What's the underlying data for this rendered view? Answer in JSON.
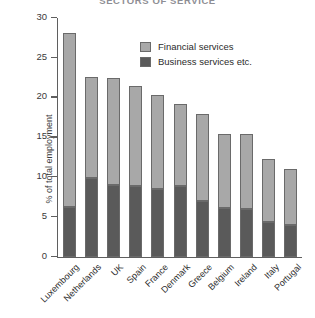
{
  "chart_data": {
    "type": "bar",
    "subtype": "stacked-vertical",
    "title": "SECTORS OF SERVICE",
    "xlabel": "",
    "ylabel": "% of total employment",
    "ylim": [
      0,
      30
    ],
    "yticks": [
      0,
      5,
      10,
      15,
      20,
      25,
      30
    ],
    "ytick_labels": [
      "0",
      "5",
      "10",
      "15",
      "20",
      "25",
      "30"
    ],
    "grid": false,
    "legend_position": "upper-right-inside",
    "categories": [
      "Luxembourg",
      "Netherlands",
      "UK",
      "Spain",
      "France",
      "Denmark",
      "Greece",
      "Belgium",
      "Ireland",
      "Italy",
      "Portugal"
    ],
    "series": [
      {
        "name": "Business services etc.",
        "color": "#5a5a5a",
        "values": [
          6.3,
          9.9,
          9.0,
          8.9,
          8.6,
          8.9,
          7.0,
          6.2,
          6.0,
          4.4,
          4.0
        ]
      },
      {
        "name": "Financial services",
        "color": "#a8a8a8",
        "values": [
          21.8,
          12.7,
          13.5,
          12.6,
          11.7,
          10.3,
          10.9,
          9.2,
          9.4,
          7.9,
          7.0
        ]
      }
    ],
    "totals": [
      28.1,
      22.6,
      22.5,
      21.5,
      20.3,
      19.2,
      17.9,
      15.4,
      15.4,
      12.3,
      11.0
    ]
  },
  "legend": {
    "items": [
      {
        "label": "Financial services",
        "color": "#a8a8a8"
      },
      {
        "label": "Business services etc.",
        "color": "#5a5a5a"
      }
    ]
  }
}
